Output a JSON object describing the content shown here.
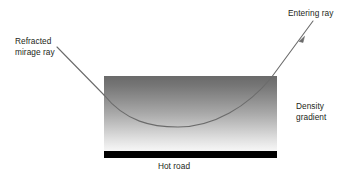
{
  "diagram": {
    "labels": {
      "refracted_mirage_ray": "Refracted\nmirage ray",
      "entering_ray": "Entering ray",
      "density_gradient": "Density\ngradient",
      "hot_road": "Hot road"
    },
    "colors": {
      "background": "#ffffff",
      "text": "#231f20",
      "ray_stroke": "#6b6b6b",
      "gradient_top": "#6e6e6e",
      "gradient_bottom": "#f4f4f4",
      "road_fill": "#000000"
    },
    "air_block": {
      "name": "density-gradient-block",
      "x": 104,
      "y": 76,
      "width": 173,
      "height": 75,
      "gradient_direction": "top-dark-to-bottom-light"
    },
    "road_bar": {
      "name": "hot-road-bar",
      "x": 104,
      "y": 151,
      "width": 173,
      "height": 7
    },
    "rays": [
      {
        "name": "refracted-mirage-ray",
        "kind": "straight-segment",
        "from": [
          57,
          47
        ],
        "to": [
          104,
          95
        ],
        "arrowhead": false
      },
      {
        "name": "entering-ray",
        "kind": "straight-segment",
        "from": [
          313,
          21
        ],
        "to": [
          271,
          78
        ],
        "arrowhead": true,
        "arrow_at": [
          299,
          40
        ]
      },
      {
        "name": "curved-ray-path",
        "kind": "curve",
        "from": [
          104,
          95
        ],
        "to": [
          271,
          78
        ],
        "lowest_point": [
          178,
          127
        ]
      }
    ]
  }
}
